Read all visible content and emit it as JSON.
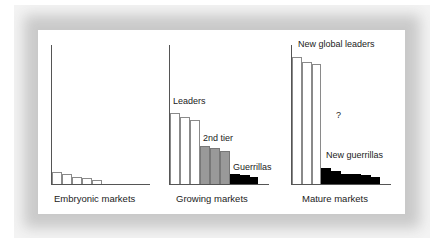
{
  "diagram": {
    "panels": [
      {
        "caption": "Embryonic markets",
        "groups": [
          {
            "label": "",
            "fill": "white",
            "heights": [
              12,
              10,
              7,
              6,
              4
            ]
          }
        ]
      },
      {
        "caption": "Growing markets",
        "groups": [
          {
            "label": "Leaders",
            "fill": "white",
            "heights": [
              71,
              67,
              64
            ]
          },
          {
            "label": "2nd tier",
            "fill": "gray",
            "heights": [
              38,
              36,
              33
            ]
          },
          {
            "label": "Guerrillas",
            "fill": "black",
            "heights": [
              10,
              9,
              7
            ]
          }
        ]
      },
      {
        "caption": "Mature markets",
        "annotation": "?",
        "groups": [
          {
            "label": "New global leaders",
            "fill": "white",
            "heights": [
              127,
              122,
              120
            ]
          },
          {
            "label": "New guerrillas",
            "fill": "black",
            "heights": [
              16,
              13,
              10,
              10,
              9,
              7
            ]
          }
        ]
      }
    ],
    "colors": {
      "white_bar": "#ffffff",
      "gray_bar": "#999999",
      "black_bar": "#000000",
      "frame": "#c9c9c9"
    }
  }
}
